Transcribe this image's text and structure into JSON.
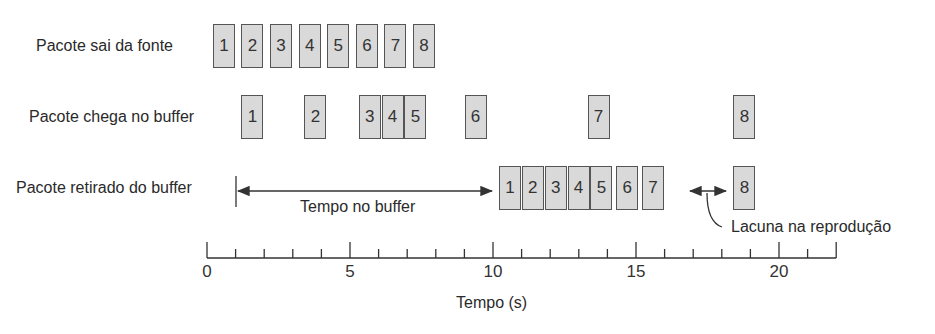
{
  "rows": [
    {
      "label": "Pacote sai da fonte",
      "packets": [
        {
          "n": "1",
          "t": 0.1
        },
        {
          "n": "2",
          "t": 1.1
        },
        {
          "n": "3",
          "t": 2.1
        },
        {
          "n": "4",
          "t": 3.1
        },
        {
          "n": "5",
          "t": 4.1
        },
        {
          "n": "6",
          "t": 5.1
        },
        {
          "n": "7",
          "t": 6.1
        },
        {
          "n": "8",
          "t": 7.1
        }
      ]
    },
    {
      "label": "Pacote chega no buffer",
      "packets": [
        {
          "n": "1",
          "t": 1.1
        },
        {
          "n": "2",
          "t": 3.3
        },
        {
          "n": "3",
          "t": 5.2
        },
        {
          "n": "4",
          "t": 6.0
        },
        {
          "n": "5",
          "t": 6.8
        },
        {
          "n": "6",
          "t": 8.9
        },
        {
          "n": "7",
          "t": 13.2
        },
        {
          "n": "8",
          "t": 18.3
        }
      ]
    },
    {
      "label": "Pacote retirado do buffer",
      "packets": [
        {
          "n": "1",
          "t": 10.1
        },
        {
          "n": "2",
          "t": 10.9
        },
        {
          "n": "3",
          "t": 11.7
        },
        {
          "n": "4",
          "t": 12.5
        },
        {
          "n": "5",
          "t": 13.3
        },
        {
          "n": "6",
          "t": 14.2
        },
        {
          "n": "7",
          "t": 15.1
        },
        {
          "n": "8",
          "t": 18.3
        }
      ]
    }
  ],
  "annotations": {
    "buffer_time": "Tempo no buffer",
    "playback_gap": "Lacuna na reprodução"
  },
  "axis": {
    "label": "Tempo (s)",
    "ticks": [
      "0",
      "5",
      "10",
      "15",
      "20"
    ],
    "min": 0,
    "max": 22,
    "minor_step": 1
  },
  "chart_data": {
    "type": "timeline",
    "title": "",
    "xlabel": "Tempo (s)",
    "xlim": [
      0,
      22
    ],
    "tick_labels": [
      "0",
      "5",
      "10",
      "15",
      "20"
    ],
    "series": [
      {
        "name": "Pacote sai da fonte",
        "packets": [
          "1",
          "2",
          "3",
          "4",
          "5",
          "6",
          "7",
          "8"
        ],
        "times": [
          0,
          1,
          2,
          3,
          4,
          5,
          6,
          7
        ]
      },
      {
        "name": "Pacote chega no buffer",
        "packets": [
          "1",
          "2",
          "3",
          "4",
          "5",
          "6",
          "7",
          "8"
        ],
        "times": [
          1,
          3.3,
          5.2,
          6,
          6.8,
          8.9,
          13.2,
          18.3
        ]
      },
      {
        "name": "Pacote retirado do buffer",
        "packets": [
          "1",
          "2",
          "3",
          "4",
          "5",
          "6",
          "7",
          "8"
        ],
        "times": [
          10.1,
          10.9,
          11.7,
          12.5,
          13.3,
          14.2,
          15.1,
          18.3
        ]
      }
    ],
    "annotations": [
      "Tempo no buffer (1s → 10s)",
      "Lacuna na reprodução (entre pacotes 7 e 8)"
    ]
  }
}
